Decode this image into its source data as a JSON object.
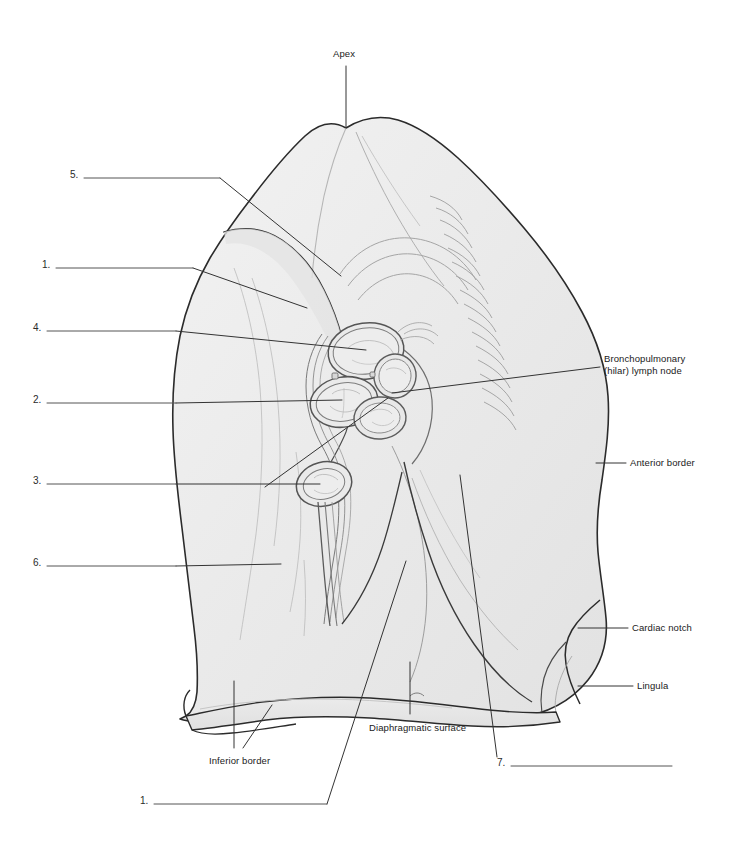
{
  "figure": {
    "organ": "left lung",
    "view": "mediastinal surface",
    "fill_color": "#e9e9e9",
    "outline_color": "#2b2b2b",
    "detail_color": "#9a9a9a",
    "leader_color": "#333333",
    "background_color": "#ffffff",
    "text_color": "#1a1a1a"
  },
  "named_labels": [
    {
      "id": "apex",
      "text": "Apex",
      "x": 333,
      "y": 54,
      "align": "left"
    },
    {
      "id": "bronchopulmonary-lymph-node",
      "text": "Bronchopulmonary\n(hilar) lymph node",
      "x": 604,
      "y": 359,
      "align": "left"
    },
    {
      "id": "anterior-border",
      "text": "Anterior border",
      "x": 630,
      "y": 457,
      "align": "left"
    },
    {
      "id": "cardiac-notch",
      "text": "Cardiac notch",
      "x": 632,
      "y": 622,
      "align": "left"
    },
    {
      "id": "lingula",
      "text": "Lingula",
      "x": 637,
      "y": 680,
      "align": "left"
    },
    {
      "id": "diaphragmatic-surface",
      "text": "Diaphragmatic surface",
      "x": 369,
      "y": 722,
      "align": "left"
    },
    {
      "id": "inferior-border",
      "text": "Inferior border",
      "x": 209,
      "y": 755,
      "align": "left"
    }
  ],
  "numbered_blanks": [
    {
      "number": "5.",
      "x": 70,
      "y": 169,
      "line_x1": 84,
      "line_x2": 220,
      "line_y": 178
    },
    {
      "number": "1.",
      "x": 42,
      "y": 259,
      "line_x1": 56,
      "line_x2": 193,
      "line_y": 268
    },
    {
      "number": "4.",
      "x": 33,
      "y": 322,
      "line_x1": 47,
      "line_x2": 176,
      "line_y": 331
    },
    {
      "number": "2.",
      "x": 33,
      "y": 394,
      "line_x1": 47,
      "line_x2": 176,
      "line_y": 403
    },
    {
      "number": "3.",
      "x": 33,
      "y": 475,
      "line_x1": 47,
      "line_x2": 176,
      "line_y": 484
    },
    {
      "number": "6.",
      "x": 33,
      "y": 557,
      "line_x1": 47,
      "line_x2": 176,
      "line_y": 566
    },
    {
      "number": "7.",
      "x": 497,
      "y": 757,
      "line_x1": 511,
      "line_x2": 672,
      "line_y": 766
    },
    {
      "number": "1.",
      "x": 140,
      "y": 795,
      "line_x1": 154,
      "line_x2": 327,
      "line_y": 804
    }
  ],
  "leader_lines": [
    {
      "for": "apex",
      "points": "346,66 346,128"
    },
    {
      "for": "5",
      "points": "220,178 341,276"
    },
    {
      "for": "1-upper",
      "points": "193,268 307,308"
    },
    {
      "for": "4",
      "points": "176,331 366,350"
    },
    {
      "for": "2",
      "points": "176,403 342,400"
    },
    {
      "for": "3",
      "points": "176,484 320,484"
    },
    {
      "for": "3-branch",
      "points": "265,487 390,398"
    },
    {
      "for": "6",
      "points": "176,566 281,564"
    },
    {
      "for": "bronchopulmonary-lymph-node",
      "points": "600,367 392,395"
    },
    {
      "for": "anterior-border",
      "points": "626,463 596,463"
    },
    {
      "for": "cardiac-notch",
      "points": "628,628 578,628"
    },
    {
      "for": "lingula",
      "points": "633,686 578,686"
    },
    {
      "for": "diaphragmatic-surface",
      "points": "410,714 410,662"
    },
    {
      "for": "inferior-border-left",
      "points": "234,748 234,681"
    },
    {
      "for": "inferior-border-right",
      "points": "243,748 272,705"
    },
    {
      "for": "7",
      "points": "497,757 460,475"
    },
    {
      "for": "1-lower",
      "points": "327,804 406,561"
    }
  ],
  "colors": {
    "lung_fill": "#e9e9e9",
    "lung_fill_light": "#efefef",
    "outline": "#2b2b2b",
    "hilum_stroke": "#555555",
    "faint_detail": "#aaaaaa",
    "leader": "#333333",
    "label_text": "#1a1a1a"
  }
}
